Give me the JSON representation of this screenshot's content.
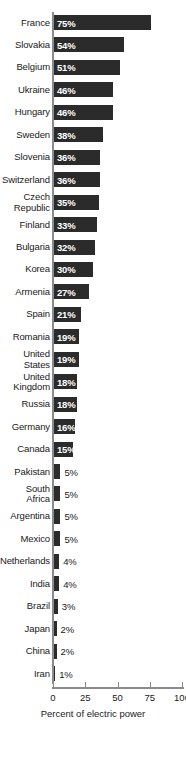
{
  "chart_data": {
    "type": "bar",
    "orientation": "horizontal",
    "title": "",
    "xlabel": "Percent of electric power",
    "ylabel": "",
    "xlim": [
      0,
      100
    ],
    "xticks": [
      0,
      25,
      50,
      75,
      100
    ],
    "xtick_labels": [
      "0",
      "25",
      "50",
      "75",
      "100"
    ],
    "grid": false,
    "legend": null,
    "value_suffix": "%",
    "bar_color": "#2b2b2b",
    "axis_color": "#8b8b8b",
    "text_color": "#1a1a1a",
    "inside_label_color": "#ffffff",
    "categories": [
      "France",
      "Slovakia",
      "Belgium",
      "Ukraine",
      "Hungary",
      "Sweden",
      "Slovenia",
      "Switzerland",
      "Czech\nRepublic",
      "Finland",
      "Bulgaria",
      "Korea",
      "Armenia",
      "Spain",
      "Romania",
      "United\nStates",
      "United\nKingdom",
      "Russia",
      "Germany",
      "Canada",
      "Pakistan",
      "South\nAfrica",
      "Argentina",
      "Mexico",
      "Netherlands",
      "India",
      "Brazil",
      "Japan",
      "China",
      "Iran"
    ],
    "values": [
      75,
      54,
      51,
      46,
      46,
      38,
      36,
      36,
      35,
      33,
      32,
      30,
      27,
      21,
      19,
      19,
      18,
      18,
      16,
      15,
      5,
      5,
      5,
      5,
      4,
      4,
      3,
      2,
      2,
      1
    ],
    "data_labels": [
      "75%",
      "54%",
      "51%",
      "46%",
      "46%",
      "38%",
      "36%",
      "36%",
      "35%",
      "33%",
      "32%",
      "30%",
      "27%",
      "21%",
      "19%",
      "19%",
      "18%",
      "18%",
      "16%",
      "15%",
      "5%",
      "5%",
      "5%",
      "5%",
      "4%",
      "4%",
      "3%",
      "2%",
      "2%",
      "1%"
    ]
  }
}
